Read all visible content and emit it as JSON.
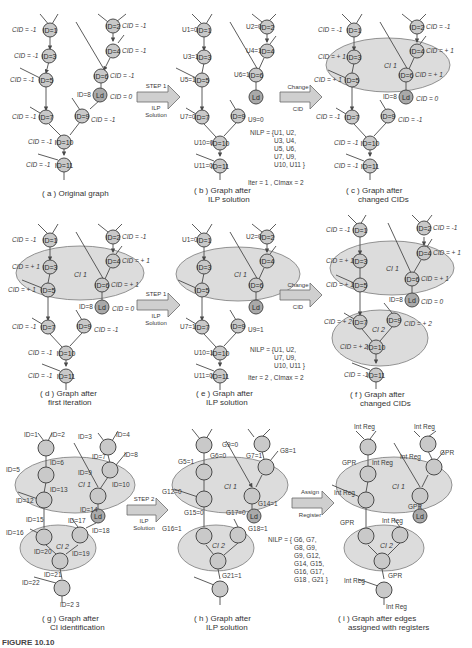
{
  "figure": {
    "caption_label": "FIGURE 10.10"
  },
  "panels": {
    "a": {
      "caption_line1": "( a ) Original graph",
      "caption_line2": "",
      "cids": {
        "n1": "CID = -1",
        "n2": "CID = -1",
        "n3": "CID = -1",
        "n4": "CID = -1",
        "n5": "CID = -1",
        "n6": "CID = -1",
        "ld": "CID = 0",
        "n7": "CID = -1",
        "n9": "CID = -1",
        "n10": "CID = -1",
        "n11": "CID = -1"
      }
    },
    "b": {
      "caption_line1": "( b ) Graph after",
      "caption_line2": "ILP solution",
      "u": {
        "n1": "U1=0",
        "n2": "U2=0",
        "n3": "U3=1",
        "n4": "U4=1",
        "n5": "U5=1",
        "n6": "U6=1",
        "n7": "U7=0",
        "n9": "U9=0",
        "n10": "U10=0",
        "n11": "U11=0"
      },
      "nilp_label": "NILP = {",
      "nilp_lines": [
        "U1, U2,",
        "U3, U4,",
        "U5, U6,",
        "U7, U9,",
        "U10, U11 }"
      ],
      "iter": "Iter = 1 , CImax = 2"
    },
    "c": {
      "caption_line1": "( c ) Graph after",
      "caption_line2": "changed CIDs",
      "ci_label": "CI 1",
      "cids": {
        "n1": "CID = -1",
        "n2": "CID = -1",
        "n3": "CID = + 1",
        "n4": "CID = + 1",
        "n5": "CID = + 1",
        "n6": "CID = + 1",
        "ld": "CID = 0",
        "n7": "CID = -1",
        "n9": "CID = -1",
        "n10": "CID = -1",
        "n11": "CID = -1"
      }
    },
    "d": {
      "caption_line1": "( d ) Graph after",
      "caption_line2": "first iteration",
      "ci_label": "CI 1",
      "cids": {
        "n1": "CID = -1",
        "n2": "CID = -1",
        "n3": "CID = + 1",
        "n4": "CID = + 1",
        "n5": "CID = + 1",
        "n6": "CID = + 1",
        "ld": "CID = 0",
        "n7": "CID = -1",
        "n9": "CID = -1",
        "n10": "CID = -1",
        "n11": "CID = -1"
      }
    },
    "e": {
      "caption_line1": "( e ) Graph after",
      "caption_line2": "ILP solution",
      "ci_label": "CI 1",
      "u": {
        "n1": "U1=0",
        "n2": "U2=0",
        "n7": "U7=1",
        "n9": "U9=1",
        "n10": "U10=1",
        "n11": "U11=0"
      },
      "nilp_label": "NILP = {",
      "nilp_lines": [
        "U1, U2,",
        "U7, U9,",
        "U10, U11 }"
      ],
      "iter": "Iter = 2 , CImax = 2"
    },
    "f": {
      "caption_line1": "( f ) Graph after",
      "caption_line2": "changed CIDs",
      "ci1_label": "CI 1",
      "ci2_label": "CI 2",
      "cids": {
        "n1": "CID = -1",
        "n2": "CID = -1",
        "n3": "CID = + 1",
        "n4": "CID = + 1",
        "n5": "CID = + 1",
        "n6": "CID = + 1",
        "ld": "CID = 0",
        "n7": "CID = + 2",
        "n9": "CID = + 2",
        "n10": "CID = + 2",
        "n11": "CID = -1"
      }
    },
    "g": {
      "caption_line1": "( g ) Graph after",
      "caption_line2": "CI identification",
      "ci1_label": "CI 1",
      "ci2_label": "CI 2",
      "edge_ids": {
        "e1": "ID=1",
        "e2": "ID=2",
        "e3": "ID=3",
        "e4": "ID=4",
        "e5": "ID=5",
        "e6": "ID=6",
        "e7": "ID=7",
        "e8": "ID=8",
        "e9": "ID=9",
        "e10": "ID=10",
        "e12": "ID=12",
        "e13": "ID=13",
        "e14": "ID=14",
        "e15": "ID=15",
        "e16": "ID=16",
        "e17": "ID=17",
        "e18": "ID=18",
        "e19": "ID=19",
        "e20": "ID=20",
        "e21": "ID=21",
        "e22": "ID=22",
        "e23": "ID=2 3"
      }
    },
    "h": {
      "caption_line1": "( h ) Graph after",
      "caption_line2": "ILP solution",
      "ci1_label": "CI 1",
      "ci2_label": "CI 2",
      "g": {
        "g5": "G5=1",
        "g6": "G6=0",
        "g9": "G9=0",
        "g7": "G7=1",
        "g8": "G8=1",
        "g12": "G12=0",
        "g14": "G14=1",
        "g15": "G15=0",
        "g17": "G17=0",
        "g16": "G16=1",
        "g18": "G18=1",
        "g21": "G21=1"
      },
      "nilp_label": "NILP = { G6, G7,",
      "nilp_lines": [
        "G8, G9,",
        "G9, G12,",
        "G14, G15,",
        "G16, G17,",
        "G18 , G21 }"
      ]
    },
    "i": {
      "caption_line1": "( i ) Graph after edges",
      "caption_line2": "assigned with registers",
      "ci1_label": "CI 1",
      "ci2_label": "CI 2",
      "regs": {
        "r1": "Int Reg",
        "r2": "Int Reg",
        "r3": "GPR",
        "r4": "Int Reg",
        "r5": "Int Reg",
        "r6": "GPR",
        "r7": "Int Reg",
        "r8": "GPR",
        "r9": "GPR",
        "r10": "Int Reg",
        "r11": "GPR",
        "r12": "Int Reg",
        "r13": "Int Reg"
      }
    }
  },
  "arrows": {
    "ab": {
      "top": "STEP 1",
      "bottom_line1": "ILP",
      "bottom_line2": "Solution"
    },
    "bc": {
      "top": "Change",
      "bottom_line1": "CID",
      "bottom_line2": ""
    },
    "de": {
      "top": "STEP 1",
      "bottom_line1": "ILP",
      "bottom_line2": "Solution"
    },
    "ef": {
      "top": "Change",
      "bottom_line1": "CID",
      "bottom_line2": ""
    },
    "gh": {
      "top": "STEP 2",
      "bottom_line1": "ILP",
      "bottom_line2": "Solution"
    },
    "hi": {
      "top": "Assign",
      "bottom_line1": "Register",
      "bottom_line2": ""
    }
  },
  "node_labels": {
    "n1": "ID=1",
    "n2": "ID=2",
    "n3": "ID=3",
    "n4": "ID=4",
    "n5": "ID=5",
    "n6": "ID=6",
    "n7": "ID=7",
    "n9": "ID=9",
    "n10": "ID=10",
    "n11": "ID=11",
    "ld": "Ld",
    "ld_id": "ID=8"
  },
  "colors": {
    "node": "#c9c9c9",
    "ld_node": "#a9a9a9",
    "ellipse": "#dcdcdc",
    "edge": "#4a4a4a"
  }
}
